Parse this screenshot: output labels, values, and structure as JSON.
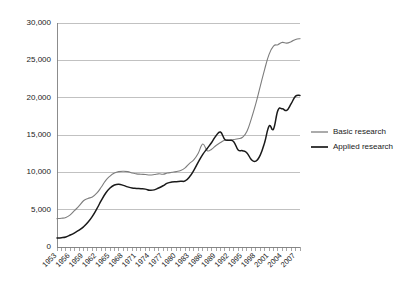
{
  "chart_data": {
    "type": "line",
    "title": "",
    "subtitle": "",
    "xlabel": "",
    "ylabel": "",
    "xlim": [
      1953,
      2008
    ],
    "ylim": [
      0,
      30000
    ],
    "grid": true,
    "legend_position": "right",
    "y_ticks": [
      0,
      5000,
      10000,
      15000,
      20000,
      25000,
      30000
    ],
    "y_tick_labels": [
      "0",
      "5,000",
      "10,000",
      "15,000",
      "20,000",
      "25,000",
      "30,000"
    ],
    "x_tick_labels": [
      "1953",
      "1956",
      "1959",
      "1962",
      "1965",
      "1968",
      "1971",
      "1974",
      "1977",
      "1980",
      "1983",
      "1986",
      "1989",
      "1992",
      "1995",
      "1998",
      "2001",
      "2004",
      "2007"
    ],
    "x_minor_ticks_every_years": 1,
    "x": [
      1953,
      1954,
      1955,
      1956,
      1957,
      1958,
      1959,
      1960,
      1961,
      1962,
      1963,
      1964,
      1965,
      1966,
      1967,
      1968,
      1969,
      1970,
      1971,
      1972,
      1973,
      1974,
      1975,
      1976,
      1977,
      1978,
      1979,
      1980,
      1981,
      1982,
      1983,
      1984,
      1985,
      1986,
      1987,
      1988,
      1989,
      1990,
      1991,
      1992,
      1993,
      1994,
      1995,
      1996,
      1997,
      1998,
      1999,
      2000,
      2001,
      2002,
      2003,
      2004,
      2005,
      2006,
      2007,
      2008
    ],
    "series": [
      {
        "name": "Basic research",
        "color": "#7d7d7d",
        "values": [
          3800,
          3850,
          3950,
          4300,
          4900,
          5500,
          6200,
          6500,
          6700,
          7200,
          8000,
          8900,
          9500,
          9900,
          10100,
          10150,
          10100,
          9900,
          9800,
          9750,
          9700,
          9650,
          9700,
          9800,
          9750,
          9900,
          10000,
          10100,
          10250,
          10600,
          11200,
          11700,
          12600,
          13800,
          12900,
          13100,
          13600,
          14000,
          14300,
          14300,
          14400,
          14500,
          14700,
          15500,
          17200,
          19200,
          21500,
          23800,
          25800,
          26900,
          27100,
          27400,
          27300,
          27500,
          27800,
          27900
        ]
      },
      {
        "name": "Applied research",
        "color": "#1a1a1a",
        "values": [
          1200,
          1250,
          1350,
          1600,
          1900,
          2250,
          2700,
          3300,
          4100,
          5100,
          6200,
          7200,
          7900,
          8300,
          8400,
          8250,
          8050,
          7900,
          7850,
          7800,
          7750,
          7600,
          7650,
          7900,
          8200,
          8550,
          8700,
          8750,
          8800,
          8850,
          9400,
          10300,
          11400,
          12400,
          13200,
          14000,
          14900,
          15400,
          14400,
          14300,
          14100,
          13000,
          12900,
          12600,
          11700,
          11500,
          12300,
          14000,
          16200,
          15800,
          18300,
          18500,
          18300,
          19200,
          20200,
          20300
        ]
      }
    ]
  },
  "legend": {
    "items": [
      {
        "label": "Basic research",
        "color": "#7d7d7d"
      },
      {
        "label": "Applied research",
        "color": "#1a1a1a"
      }
    ]
  },
  "plot_area": {
    "left": 57,
    "right": 300,
    "top": 23,
    "bottom": 247
  }
}
